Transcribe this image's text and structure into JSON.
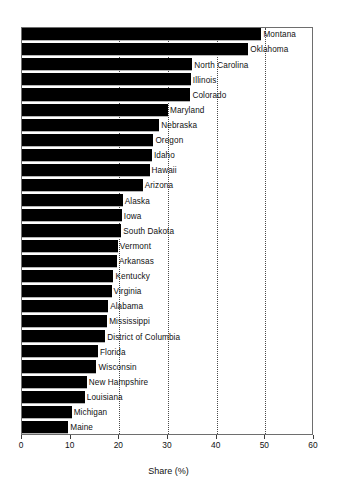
{
  "chart_data": {
    "type": "bar",
    "orientation": "horizontal",
    "title": "",
    "subtitle": "",
    "xlabel": "Share (%)",
    "ylabel": "",
    "xlim": [
      0,
      60
    ],
    "xticks": [
      0,
      10,
      20,
      30,
      40,
      50,
      60
    ],
    "xtick_labels": [
      "0",
      "10",
      "20",
      "30",
      "40",
      "50",
      "60"
    ],
    "gridlines": [
      20,
      30,
      40,
      50
    ],
    "grid": "vertical-dotted",
    "legend": null,
    "bar_color": "#000000",
    "categories": [
      "Montana",
      "Oklahoma",
      "North Carolina",
      "Illinois",
      "Colorado",
      "Maryland",
      "Nebraska",
      "Oregon",
      "Idaho",
      "Hawaii",
      "Arizona",
      "Alaska",
      "Iowa",
      "South Dakota",
      "Vermont",
      "Arkansas",
      "Kentucky",
      "Virginia",
      "Alabama",
      "Mississippi",
      "District of Columbia",
      "Florida",
      "Wisconsin",
      "New Hampshire",
      "Louisiana",
      "Michigan",
      "Maine"
    ],
    "values": [
      49.2,
      46.5,
      35.0,
      34.7,
      34.6,
      30.0,
      28.2,
      27.0,
      26.7,
      26.2,
      24.8,
      20.7,
      20.5,
      20.4,
      19.7,
      19.5,
      18.8,
      18.4,
      17.7,
      17.5,
      17.1,
      15.6,
      15.3,
      13.3,
      12.9,
      10.2,
      9.5
    ]
  },
  "axis": {
    "x_title": "Share (%)"
  }
}
